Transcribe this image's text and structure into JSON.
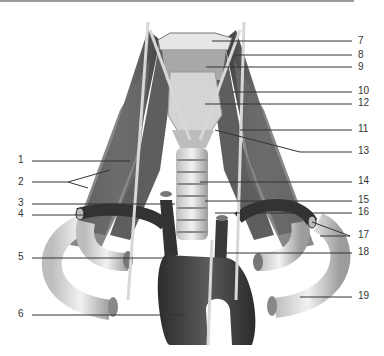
{
  "figure": {
    "type": "anatomical-illustration",
    "colors": {
      "background": "#ffffff",
      "line": "#333333",
      "muscle": "#5a5a5a",
      "vessel_dark": "#3a3a3a",
      "cartilage": "#d8d8d8",
      "rule": "#9a9a9a"
    }
  },
  "labels": {
    "left": [
      {
        "num": "1",
        "y": 160
      },
      {
        "num": "2",
        "y": 182
      },
      {
        "num": "3",
        "y": 203
      },
      {
        "num": "4",
        "y": 214
      },
      {
        "num": "5",
        "y": 257
      },
      {
        "num": "6",
        "y": 314
      }
    ],
    "right": [
      {
        "num": "7",
        "y": 41
      },
      {
        "num": "8",
        "y": 55
      },
      {
        "num": "9",
        "y": 67
      },
      {
        "num": "10",
        "y": 91
      },
      {
        "num": "12",
        "y": 103
      },
      {
        "num": "11",
        "y": 129
      },
      {
        "num": "13",
        "y": 151
      },
      {
        "num": "14",
        "y": 181
      },
      {
        "num": "15",
        "y": 200
      },
      {
        "num": "16",
        "y": 212
      },
      {
        "num": "17",
        "y": 235
      },
      {
        "num": "18",
        "y": 252
      },
      {
        "num": "19",
        "y": 296
      }
    ]
  }
}
